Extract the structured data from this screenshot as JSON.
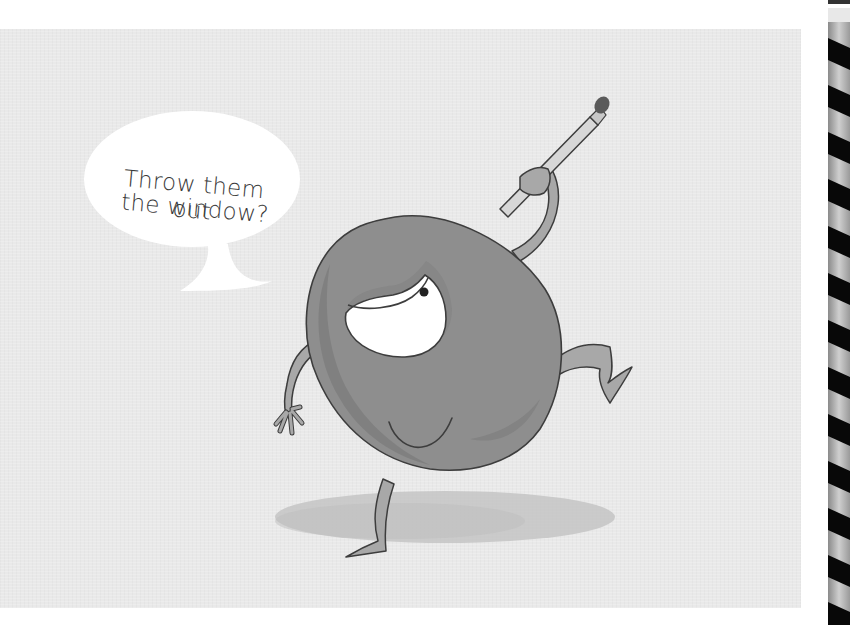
{
  "page": {
    "type": "illustrated storybook page",
    "background_color": "#ffffff",
    "panel_color": "#e9e9e9"
  },
  "illustration": {
    "subject": "one-eyed grey blob character dancing while holding a pencil aloft",
    "character_color": "#8e8e8e",
    "character_shade_color": "#7b7b7b",
    "outline_color": "#3d3d3d",
    "eye_color": "#ffffff",
    "shadow_color": "#c4c4c4"
  },
  "speech_bubble": {
    "lines": [
      "Throw them out",
      "the window?"
    ],
    "fill": "#ffffff",
    "text_color": "#3a3a3a"
  },
  "binding": {
    "type": "spiral-binding",
    "coil_count": 14,
    "coil_color": "#0a0a0a"
  }
}
